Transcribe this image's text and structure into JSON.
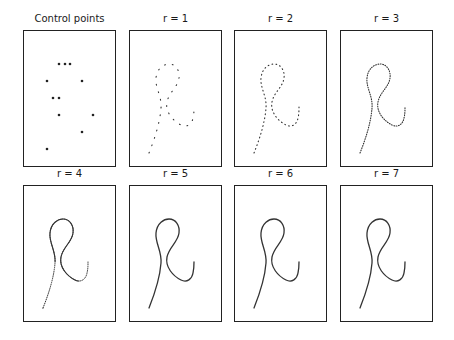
{
  "figure": {
    "panels": [
      {
        "title": "Control points",
        "kind": "points"
      },
      {
        "title": "r = 1",
        "kind": "curve",
        "r": 1
      },
      {
        "title": "r = 2",
        "kind": "curve",
        "r": 2
      },
      {
        "title": "r = 3",
        "kind": "curve",
        "r": 3
      },
      {
        "title": "r = 4",
        "kind": "curve",
        "r": 4
      },
      {
        "title": "r = 5",
        "kind": "curve",
        "r": 5
      },
      {
        "title": "r = 6",
        "kind": "curve",
        "r": 6
      },
      {
        "title": "r = 7",
        "kind": "curve",
        "r": 7
      }
    ],
    "control_points": [
      [
        36,
        34
      ],
      [
        42,
        34
      ],
      [
        47,
        34
      ],
      [
        24,
        51
      ],
      [
        59,
        51
      ],
      [
        30,
        68
      ],
      [
        36,
        68
      ],
      [
        36,
        85
      ],
      [
        70,
        85
      ],
      [
        59,
        102
      ],
      [
        24,
        119
      ]
    ],
    "curve_path": "M20,123 C26,108 31,92 32,78 C33,66 26,58 27,48 C28,38 35,34 40,34 C47,34 51,41 50,48 C49,57 40,62 38,72 C36,82 44,91 52,95 C58,98 63,94 64,88 C65,84 65,80 65,77",
    "colors": {
      "curve": "#333333",
      "points": "#222222",
      "frame": "#222222"
    }
  }
}
